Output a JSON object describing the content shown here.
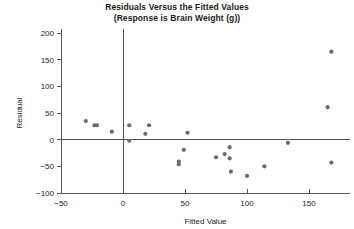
{
  "chart_data": {
    "type": "scatter",
    "title": "Residuals Versus the Fitted Values",
    "subtitle": "(Response is Brain Weight (g))",
    "xlabel": "Fitted Value",
    "ylabel": "Residual",
    "xlim": [
      -50,
      180
    ],
    "ylim": [
      -100,
      200
    ],
    "xticks": [
      -50,
      0,
      50,
      100,
      150
    ],
    "yticks": [
      -100,
      -50,
      0,
      50,
      100,
      150,
      200
    ],
    "xticklabels": [
      "−50",
      "0",
      "50",
      "100",
      "150"
    ],
    "yticklabels": [
      "−100",
      "−50",
      "0",
      "50",
      "100",
      "150",
      "200"
    ],
    "grid": false,
    "legend": null,
    "zero_reference_line": 0,
    "point_color": "#6b6b6b",
    "axis_color": "#555555",
    "points": [
      {
        "x": -30,
        "y": 35
      },
      {
        "x": -23,
        "y": 27
      },
      {
        "x": -21,
        "y": 27
      },
      {
        "x": -9,
        "y": 15
      },
      {
        "x": 5,
        "y": 27
      },
      {
        "x": 5,
        "y": -2
      },
      {
        "x": 18,
        "y": 11
      },
      {
        "x": 21,
        "y": 27
      },
      {
        "x": 45,
        "y": -41
      },
      {
        "x": 45,
        "y": -46
      },
      {
        "x": 49,
        "y": -19
      },
      {
        "x": 52,
        "y": 13
      },
      {
        "x": 75,
        "y": -33
      },
      {
        "x": 82,
        "y": -27
      },
      {
        "x": 86,
        "y": -14
      },
      {
        "x": 86,
        "y": -35
      },
      {
        "x": 87,
        "y": -60
      },
      {
        "x": 100,
        "y": -68
      },
      {
        "x": 114,
        "y": -50
      },
      {
        "x": 133,
        "y": -6
      },
      {
        "x": 165,
        "y": 61
      },
      {
        "x": 168,
        "y": 165
      },
      {
        "x": 168,
        "y": -43
      }
    ]
  }
}
